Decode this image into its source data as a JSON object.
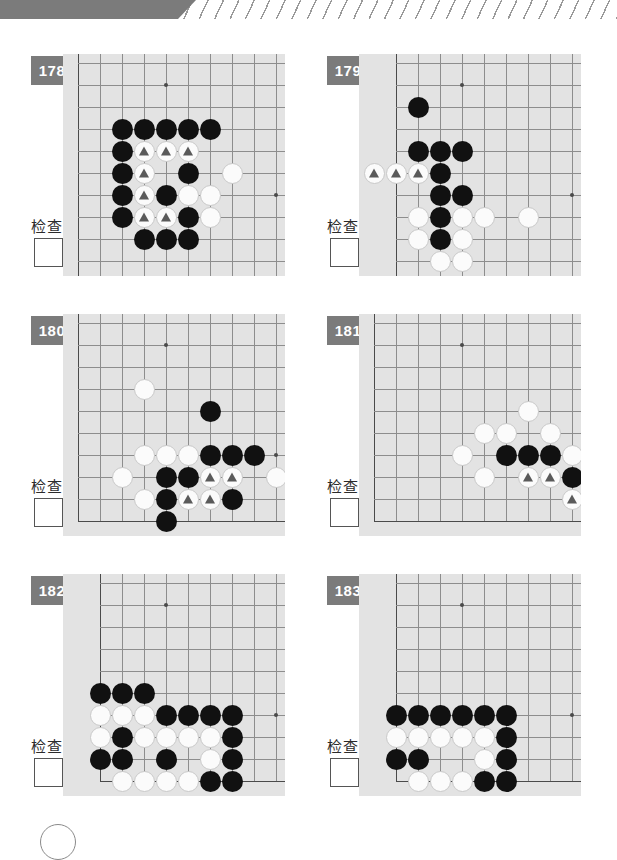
{
  "page": {
    "check_label": "检查",
    "badge_color": "#7b7b7b",
    "board_color": "#e3e3e3",
    "grid_line_color": "#8d8d8d",
    "black_stone_color": "#111111",
    "white_stone_color": "#fbfbfb",
    "marker_color": "#5a5a5a"
  },
  "board_spec": {
    "cols": 10,
    "rows": 10,
    "spacing": 22,
    "origin_x": 15,
    "origin_y": 9
  },
  "problems": [
    {
      "number": "178",
      "check_label": "检查",
      "edges": {
        "left": true,
        "right": false,
        "top": false,
        "bottom": false
      },
      "left_edge_col": 0,
      "stars": [
        [
          4,
          1
        ],
        [
          9,
          6
        ]
      ],
      "stones": [
        {
          "c": 2,
          "r": 3,
          "color": "black"
        },
        {
          "c": 3,
          "r": 3,
          "color": "black"
        },
        {
          "c": 4,
          "r": 3,
          "color": "black"
        },
        {
          "c": 5,
          "r": 3,
          "color": "black"
        },
        {
          "c": 6,
          "r": 3,
          "color": "black"
        },
        {
          "c": 2,
          "r": 4,
          "color": "black"
        },
        {
          "c": 3,
          "r": 4,
          "color": "white",
          "mark": true
        },
        {
          "c": 4,
          "r": 4,
          "color": "white",
          "mark": true
        },
        {
          "c": 5,
          "r": 4,
          "color": "white",
          "mark": true
        },
        {
          "c": 2,
          "r": 5,
          "color": "black"
        },
        {
          "c": 3,
          "r": 5,
          "color": "white",
          "mark": true
        },
        {
          "c": 5,
          "r": 5,
          "color": "black"
        },
        {
          "c": 7,
          "r": 5,
          "color": "white"
        },
        {
          "c": 2,
          "r": 6,
          "color": "black"
        },
        {
          "c": 3,
          "r": 6,
          "color": "white",
          "mark": true
        },
        {
          "c": 4,
          "r": 6,
          "color": "black"
        },
        {
          "c": 5,
          "r": 6,
          "color": "white"
        },
        {
          "c": 6,
          "r": 6,
          "color": "white"
        },
        {
          "c": 2,
          "r": 7,
          "color": "black"
        },
        {
          "c": 3,
          "r": 7,
          "color": "white",
          "mark": true
        },
        {
          "c": 4,
          "r": 7,
          "color": "white",
          "mark": true
        },
        {
          "c": 5,
          "r": 7,
          "color": "black"
        },
        {
          "c": 6,
          "r": 7,
          "color": "white"
        },
        {
          "c": 3,
          "r": 8,
          "color": "black"
        },
        {
          "c": 4,
          "r": 8,
          "color": "black"
        },
        {
          "c": 5,
          "r": 8,
          "color": "black"
        }
      ]
    },
    {
      "number": "179",
      "check_label": "检查",
      "edges": {
        "left": true,
        "right": false,
        "top": false,
        "bottom": false
      },
      "left_edge_col": 1,
      "stars": [
        [
          4,
          1
        ],
        [
          9,
          6
        ]
      ],
      "stones": [
        {
          "c": 2,
          "r": 2,
          "color": "black"
        },
        {
          "c": 2,
          "r": 4,
          "color": "black"
        },
        {
          "c": 3,
          "r": 4,
          "color": "black"
        },
        {
          "c": 4,
          "r": 4,
          "color": "black"
        },
        {
          "c": 0,
          "r": 5,
          "color": "white",
          "mark": true
        },
        {
          "c": 1,
          "r": 5,
          "color": "white",
          "mark": true
        },
        {
          "c": 2,
          "r": 5,
          "color": "white",
          "mark": true
        },
        {
          "c": 3,
          "r": 5,
          "color": "black"
        },
        {
          "c": 3,
          "r": 6,
          "color": "black"
        },
        {
          "c": 4,
          "r": 6,
          "color": "black"
        },
        {
          "c": 2,
          "r": 7,
          "color": "white"
        },
        {
          "c": 3,
          "r": 7,
          "color": "black"
        },
        {
          "c": 4,
          "r": 7,
          "color": "white"
        },
        {
          "c": 5,
          "r": 7,
          "color": "white"
        },
        {
          "c": 7,
          "r": 7,
          "color": "white"
        },
        {
          "c": 2,
          "r": 8,
          "color": "white"
        },
        {
          "c": 3,
          "r": 8,
          "color": "black"
        },
        {
          "c": 4,
          "r": 8,
          "color": "white"
        },
        {
          "c": 3,
          "r": 9,
          "color": "white"
        },
        {
          "c": 4,
          "r": 9,
          "color": "white"
        }
      ]
    },
    {
      "number": "180",
      "check_label": "检查",
      "edges": {
        "left": true,
        "right": false,
        "top": false,
        "bottom": true
      },
      "left_edge_col": 0,
      "stars": [
        [
          4,
          1
        ],
        [
          9,
          6
        ]
      ],
      "stones": [
        {
          "c": 3,
          "r": 3,
          "color": "white"
        },
        {
          "c": 6,
          "r": 4,
          "color": "black"
        },
        {
          "c": 3,
          "r": 6,
          "color": "white"
        },
        {
          "c": 4,
          "r": 6,
          "color": "white"
        },
        {
          "c": 5,
          "r": 6,
          "color": "white"
        },
        {
          "c": 6,
          "r": 6,
          "color": "black"
        },
        {
          "c": 7,
          "r": 6,
          "color": "black"
        },
        {
          "c": 8,
          "r": 6,
          "color": "black"
        },
        {
          "c": 2,
          "r": 7,
          "color": "white"
        },
        {
          "c": 4,
          "r": 7,
          "color": "black"
        },
        {
          "c": 5,
          "r": 7,
          "color": "black"
        },
        {
          "c": 6,
          "r": 7,
          "color": "white",
          "mark": true
        },
        {
          "c": 7,
          "r": 7,
          "color": "white",
          "mark": true
        },
        {
          "c": 9,
          "r": 7,
          "color": "white"
        },
        {
          "c": 10,
          "r": 7,
          "color": "white"
        },
        {
          "c": 3,
          "r": 8,
          "color": "white"
        },
        {
          "c": 4,
          "r": 8,
          "color": "black"
        },
        {
          "c": 5,
          "r": 8,
          "color": "white",
          "mark": true
        },
        {
          "c": 6,
          "r": 8,
          "color": "white",
          "mark": true
        },
        {
          "c": 7,
          "r": 8,
          "color": "black"
        },
        {
          "c": 4,
          "r": 9,
          "color": "black"
        }
      ]
    },
    {
      "number": "181",
      "check_label": "检查",
      "edges": {
        "left": true,
        "right": false,
        "top": false,
        "bottom": true
      },
      "left_edge_col": 0,
      "stars": [
        [
          4,
          1
        ],
        [
          9,
          6
        ]
      ],
      "stones": [
        {
          "c": 7,
          "r": 4,
          "color": "white"
        },
        {
          "c": 5,
          "r": 5,
          "color": "white"
        },
        {
          "c": 6,
          "r": 5,
          "color": "white"
        },
        {
          "c": 8,
          "r": 5,
          "color": "white"
        },
        {
          "c": 4,
          "r": 6,
          "color": "white"
        },
        {
          "c": 6,
          "r": 6,
          "color": "black"
        },
        {
          "c": 7,
          "r": 6,
          "color": "black"
        },
        {
          "c": 8,
          "r": 6,
          "color": "black"
        },
        {
          "c": 9,
          "r": 6,
          "color": "white"
        },
        {
          "c": 5,
          "r": 7,
          "color": "white"
        },
        {
          "c": 7,
          "r": 7,
          "color": "white",
          "mark": true
        },
        {
          "c": 8,
          "r": 7,
          "color": "white",
          "mark": true
        },
        {
          "c": 9,
          "r": 7,
          "color": "black"
        },
        {
          "c": 10,
          "r": 7,
          "color": "black"
        },
        {
          "c": 9,
          "r": 8,
          "color": "white",
          "mark": true
        },
        {
          "c": 10,
          "r": 8,
          "color": "black"
        },
        {
          "c": 10,
          "r": 9,
          "color": "black"
        }
      ]
    },
    {
      "number": "182",
      "check_label": "检查",
      "edges": {
        "left": true,
        "right": false,
        "top": false,
        "bottom": true
      },
      "left_edge_col": 1,
      "stars": [
        [
          4,
          1
        ],
        [
          9,
          6
        ]
      ],
      "stones": [
        {
          "c": 1,
          "r": 5,
          "color": "black"
        },
        {
          "c": 2,
          "r": 5,
          "color": "black"
        },
        {
          "c": 3,
          "r": 5,
          "color": "black"
        },
        {
          "c": 1,
          "r": 6,
          "color": "white"
        },
        {
          "c": 2,
          "r": 6,
          "color": "white"
        },
        {
          "c": 3,
          "r": 6,
          "color": "white"
        },
        {
          "c": 4,
          "r": 6,
          "color": "black"
        },
        {
          "c": 5,
          "r": 6,
          "color": "black"
        },
        {
          "c": 6,
          "r": 6,
          "color": "black"
        },
        {
          "c": 7,
          "r": 6,
          "color": "black"
        },
        {
          "c": 1,
          "r": 7,
          "color": "white"
        },
        {
          "c": 2,
          "r": 7,
          "color": "black"
        },
        {
          "c": 3,
          "r": 7,
          "color": "white"
        },
        {
          "c": 4,
          "r": 7,
          "color": "white"
        },
        {
          "c": 5,
          "r": 7,
          "color": "white"
        },
        {
          "c": 6,
          "r": 7,
          "color": "white"
        },
        {
          "c": 7,
          "r": 7,
          "color": "black"
        },
        {
          "c": 1,
          "r": 8,
          "color": "black"
        },
        {
          "c": 2,
          "r": 8,
          "color": "black"
        },
        {
          "c": 4,
          "r": 8,
          "color": "black"
        },
        {
          "c": 6,
          "r": 8,
          "color": "white"
        },
        {
          "c": 7,
          "r": 8,
          "color": "black"
        },
        {
          "c": 2,
          "r": 9,
          "color": "white"
        },
        {
          "c": 3,
          "r": 9,
          "color": "white"
        },
        {
          "c": 4,
          "r": 9,
          "color": "white"
        },
        {
          "c": 5,
          "r": 9,
          "color": "white"
        },
        {
          "c": 6,
          "r": 9,
          "color": "black"
        },
        {
          "c": 7,
          "r": 9,
          "color": "black"
        }
      ]
    },
    {
      "number": "183",
      "check_label": "检查",
      "edges": {
        "left": true,
        "right": false,
        "top": false,
        "bottom": true
      },
      "left_edge_col": 1,
      "stars": [
        [
          4,
          1
        ],
        [
          9,
          6
        ]
      ],
      "stones": [
        {
          "c": 1,
          "r": 6,
          "color": "black"
        },
        {
          "c": 2,
          "r": 6,
          "color": "black"
        },
        {
          "c": 3,
          "r": 6,
          "color": "black"
        },
        {
          "c": 4,
          "r": 6,
          "color": "black"
        },
        {
          "c": 5,
          "r": 6,
          "color": "black"
        },
        {
          "c": 6,
          "r": 6,
          "color": "black"
        },
        {
          "c": 1,
          "r": 7,
          "color": "white"
        },
        {
          "c": 2,
          "r": 7,
          "color": "white"
        },
        {
          "c": 3,
          "r": 7,
          "color": "white"
        },
        {
          "c": 4,
          "r": 7,
          "color": "white"
        },
        {
          "c": 5,
          "r": 7,
          "color": "white"
        },
        {
          "c": 6,
          "r": 7,
          "color": "black"
        },
        {
          "c": 1,
          "r": 8,
          "color": "black"
        },
        {
          "c": 2,
          "r": 8,
          "color": "black"
        },
        {
          "c": 5,
          "r": 8,
          "color": "white"
        },
        {
          "c": 6,
          "r": 8,
          "color": "black"
        },
        {
          "c": 2,
          "r": 9,
          "color": "white"
        },
        {
          "c": 3,
          "r": 9,
          "color": "white"
        },
        {
          "c": 4,
          "r": 9,
          "color": "white"
        },
        {
          "c": 5,
          "r": 9,
          "color": "black"
        },
        {
          "c": 6,
          "r": 9,
          "color": "black"
        }
      ]
    }
  ]
}
